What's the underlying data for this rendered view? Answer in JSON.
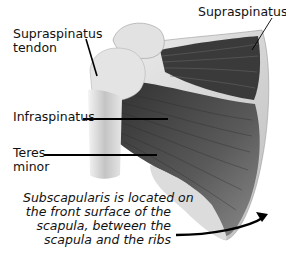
{
  "diagram": {
    "labels": {
      "supraspinatus_tendon_line1": "Supraspinatus",
      "supraspinatus_tendon_line2": "tendon",
      "supraspinatus": "Supraspinatus",
      "infraspinatus": "Infraspinatus",
      "teres_minor_line1": "Teres",
      "teres_minor_line2": "minor"
    },
    "note": {
      "line1": "Subscapularis is located on",
      "line2": "the front surface of the",
      "line3": "scapula, between the",
      "line4": "scapula and the ribs"
    },
    "colors": {
      "muscle_dark": "#3a3a3a",
      "muscle_mid": "#6e6e6e",
      "bone": "#d6d6d6",
      "bone_light": "#ececec",
      "leader_line": "#000000"
    }
  }
}
